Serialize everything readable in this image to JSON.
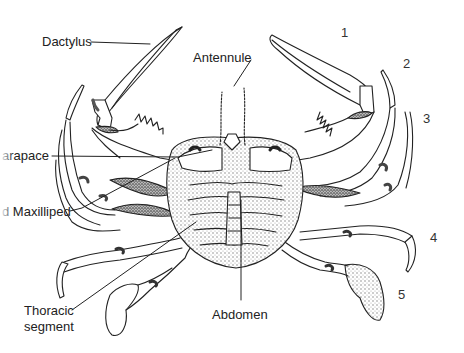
{
  "diagram": {
    "labels": {
      "dactylus": "Dactylus",
      "antennule": "Antennule",
      "carapace": "arapace",
      "maxilliped": "d Maxilliped",
      "thoracic_segment_line1": "Thoracic",
      "thoracic_segment_line2": "segment",
      "abdomen": "Abdomen"
    },
    "leg_numbers": [
      "1",
      "2",
      "3",
      "4",
      "5"
    ],
    "colors": {
      "ink": "#222222",
      "background": "#ffffff",
      "stipple": "#8a8a8a"
    }
  }
}
